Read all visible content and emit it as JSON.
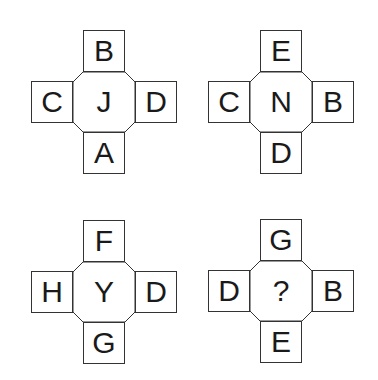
{
  "puzzle": {
    "figures": [
      {
        "top": "B",
        "left": "C",
        "center": "J",
        "right": "D",
        "bottom": "A"
      },
      {
        "top": "E",
        "left": "C",
        "center": "N",
        "right": "B",
        "bottom": "D"
      },
      {
        "top": "F",
        "left": "H",
        "center": "Y",
        "right": "D",
        "bottom": "G"
      },
      {
        "top": "G",
        "left": "D",
        "center": "?",
        "right": "B",
        "bottom": "E"
      }
    ]
  }
}
